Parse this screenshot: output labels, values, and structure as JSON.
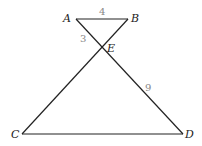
{
  "diagram": {
    "points": {
      "A": {
        "label": "A",
        "x": 76,
        "y": 19
      },
      "B": {
        "label": "B",
        "x": 128,
        "y": 19
      },
      "E": {
        "label": "E",
        "x": 102,
        "y": 49
      },
      "C": {
        "label": "C",
        "x": 22,
        "y": 134
      },
      "D": {
        "label": "D",
        "x": 183,
        "y": 134
      }
    },
    "lengths": {
      "AB": "4",
      "AE": "3",
      "ED": "9"
    },
    "colors": {
      "line": "#222222",
      "length_label": "#888888"
    }
  }
}
